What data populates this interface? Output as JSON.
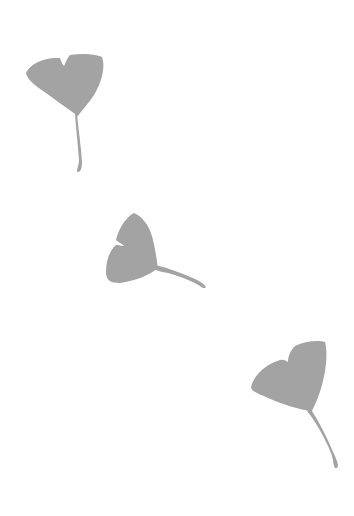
{
  "scene": {
    "description": "Three gray ginkgo leaves scattered diagonally on a white background",
    "background_color": "#ffffff",
    "leaf_color": "#a3a3a3",
    "leaves": [
      {
        "id": "leaf-top-left",
        "position": "top-left",
        "stem_direction": "down"
      },
      {
        "id": "leaf-middle",
        "position": "center-left",
        "stem_direction": "right"
      },
      {
        "id": "leaf-bottom-right",
        "position": "bottom-right",
        "stem_direction": "down"
      }
    ]
  }
}
